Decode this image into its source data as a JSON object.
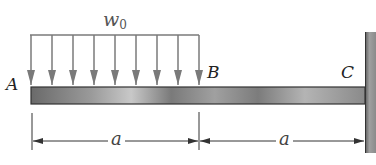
{
  "diagram": {
    "type": "cantilever-beam-with-partial-distributed-load",
    "load": {
      "label": "w",
      "subscript": "0",
      "arrow_count": 9,
      "from_point": "A",
      "to_point": "B"
    },
    "points": {
      "a": "A",
      "b": "B",
      "c": "C"
    },
    "dimensions": [
      {
        "label": "a",
        "from": "A",
        "to": "B"
      },
      {
        "label": "a",
        "from": "B",
        "to": "C"
      }
    ],
    "support": {
      "type": "fixed-wall",
      "at": "C"
    },
    "colors": {
      "beam_dark": "#555555",
      "beam_light": "#bdbdbd",
      "arrow": "#7a7a7a",
      "wall": "#8c8c8c",
      "line": "#333333"
    }
  }
}
